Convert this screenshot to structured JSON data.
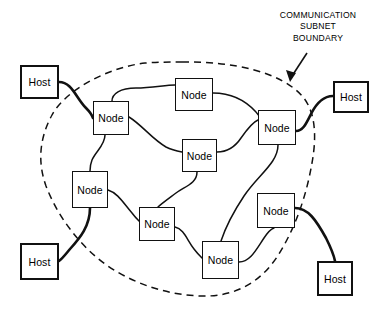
{
  "diagram": {
    "background_color": "#ffffff",
    "line_color": "#111111",
    "annotation": {
      "name": "communication-subnet-boundary-label",
      "lines": [
        "COMMUNICATION",
        "SUBNET",
        "BOUNDARY"
      ],
      "line1": "COMMUNICATION",
      "line2": "SUBNET",
      "line3": "BOUNDARY",
      "arrow_points_to": "dashed subnet boundary"
    },
    "boundary": {
      "name": "communication-subnet-boundary",
      "style": "dashed",
      "shape": "closed irregular blob"
    },
    "hosts": [
      {
        "id": "host-top-left",
        "label": "Host",
        "x": 20,
        "y": 65,
        "w": 39,
        "h": 34
      },
      {
        "id": "host-top-right",
        "label": "Host",
        "x": 333,
        "y": 81,
        "w": 36,
        "h": 32
      },
      {
        "id": "host-bottom-left",
        "label": "Host",
        "x": 20,
        "y": 243,
        "w": 39,
        "h": 37
      },
      {
        "id": "host-bottom-right",
        "label": "Host",
        "x": 317,
        "y": 261,
        "w": 36,
        "h": 35
      }
    ],
    "nodes": [
      {
        "id": "node-nw",
        "label": "Node",
        "x": 93,
        "y": 101,
        "w": 36,
        "h": 34
      },
      {
        "id": "node-n",
        "label": "Node",
        "x": 175,
        "y": 78,
        "w": 38,
        "h": 33
      },
      {
        "id": "node-e",
        "label": "Node",
        "x": 258,
        "y": 110,
        "w": 38,
        "h": 35
      },
      {
        "id": "node-center",
        "label": "Node",
        "x": 182,
        "y": 139,
        "w": 35,
        "h": 33
      },
      {
        "id": "node-w",
        "label": "Node",
        "x": 72,
        "y": 171,
        "w": 36,
        "h": 37
      },
      {
        "id": "node-sw",
        "label": "Node",
        "x": 139,
        "y": 207,
        "w": 36,
        "h": 34
      },
      {
        "id": "node-se",
        "label": "Node",
        "x": 257,
        "y": 193,
        "w": 38,
        "h": 35
      },
      {
        "id": "node-s",
        "label": "Node",
        "x": 202,
        "y": 241,
        "w": 37,
        "h": 38
      }
    ],
    "links": [
      {
        "from": "host-top-left",
        "to": "node-nw"
      },
      {
        "from": "node-nw",
        "to": "node-n"
      },
      {
        "from": "node-n",
        "to": "node-e"
      },
      {
        "from": "node-nw",
        "to": "node-center"
      },
      {
        "from": "node-center",
        "to": "node-e"
      },
      {
        "from": "node-nw",
        "to": "node-w"
      },
      {
        "from": "node-e",
        "to": "host-top-right"
      },
      {
        "from": "node-w",
        "to": "node-sw"
      },
      {
        "from": "node-w",
        "to": "host-bottom-left"
      },
      {
        "from": "node-center",
        "to": "node-sw"
      },
      {
        "from": "node-sw",
        "to": "node-s"
      },
      {
        "from": "node-e",
        "to": "node-s"
      },
      {
        "from": "node-s",
        "to": "node-se"
      },
      {
        "from": "node-se",
        "to": "host-bottom-right"
      }
    ],
    "counts": {
      "hosts": 4,
      "nodes": 8,
      "links": 14
    }
  }
}
